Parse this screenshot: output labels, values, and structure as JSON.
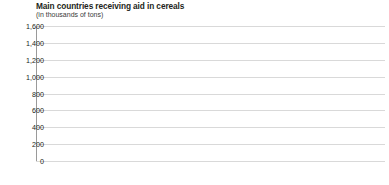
{
  "title": "Main countries receiving aid in cereals",
  "subtitle": "(in thousands of tons)",
  "axis": {
    "yticks": [
      "1,600",
      "1,400",
      "1,200",
      "1,000",
      "800",
      "600",
      "400",
      "200",
      "0"
    ],
    "groups": [
      "Europe",
      "Asia",
      "Africa",
      "Latin America"
    ]
  },
  "chart_data": {
    "type": "bar",
    "title": "Main countries receiving aid in cereals",
    "subtitle": "(in thousands of tons)",
    "xlabel": "",
    "ylabel": "(in thousands of tons)",
    "ylim": [
      0,
      1600
    ],
    "ytick_step": 200,
    "grid": true,
    "legend": "none",
    "groups": [
      {
        "name": "Europe",
        "categories": [
          "Russia",
          "Other countries"
        ],
        "series": [
          {
            "name": "Series 1",
            "values": [
              1230,
              125
            ]
          },
          {
            "name": "Series 2",
            "values": [
              1215,
              110
            ]
          }
        ]
      },
      {
        "name": "Asia",
        "categories": [
          "Bangladesh",
          "Jordan",
          "India",
          "Indonesia",
          "Yemen",
          "Other countries"
        ],
        "series": [
          {
            "name": "Series 1",
            "values": [
              1235,
              120,
              330,
              815,
              150,
              330
            ]
          },
          {
            "name": "Series 2",
            "values": [
              1225,
              105,
              310,
              800,
              135,
              315
            ]
          }
        ]
      },
      {
        "name": "Africa",
        "categories": [
          "Angola",
          "Eritrea",
          "Ethiopia",
          "Mozambique",
          "Rwanda",
          "Sudan",
          "Other countries"
        ],
        "series": [
          {
            "name": "Series 1",
            "values": [
              140,
              155,
              610,
              140,
              185,
              300,
              815
            ]
          },
          {
            "name": "Series 2",
            "values": [
              125,
              140,
              595,
              125,
              170,
              285,
              800
            ]
          }
        ]
      },
      {
        "name": "Latin America",
        "categories": [
          "Bolivia",
          "Haiti",
          "Nicaragua",
          "Peru",
          "Other countries"
        ],
        "series": [
          {
            "name": "Series 1",
            "values": [
              155,
              150,
              165,
              145,
              215
            ]
          },
          {
            "name": "Series 2",
            "values": [
              140,
              135,
              150,
              130,
              200
            ]
          }
        ]
      }
    ],
    "colors": {
      "series1": "#8f8f8f",
      "series2": "#cfcfcf",
      "grid": "#d9d9d9",
      "axis": "#9a9a9a"
    }
  }
}
